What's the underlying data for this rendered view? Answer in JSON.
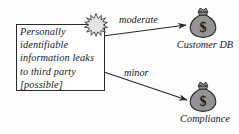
{
  "diagram": {
    "background_color": "#fdfdfd",
    "stroke_color": "#2a2a2a",
    "threat": {
      "text": "Personally identifiable information leaks to third party [possible]",
      "likelihood": "possible",
      "icon": "burst-icon"
    },
    "edges": [
      {
        "label": "moderate",
        "from": "threat-box",
        "to": "asset-customer-db"
      },
      {
        "label": "minor",
        "from": "threat-box",
        "to": "asset-compliance"
      }
    ],
    "assets": [
      {
        "label": "Customer DB",
        "icon": "money-bag-icon",
        "symbol": "$",
        "fill": "#808080"
      },
      {
        "label": "Compliance",
        "icon": "money-bag-icon",
        "symbol": "$",
        "fill": "#808080"
      }
    ]
  }
}
